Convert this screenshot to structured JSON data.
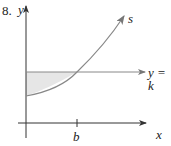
{
  "problem_number": "8.",
  "axes": {
    "x_label": "x",
    "y_label": "y"
  },
  "curve": {
    "label": "s"
  },
  "line": {
    "label": "y = k"
  },
  "tick": {
    "label": "b"
  },
  "colors": {
    "axis": "#333333",
    "curve": "#8a8a8a",
    "shade": "#e6e6e6"
  }
}
